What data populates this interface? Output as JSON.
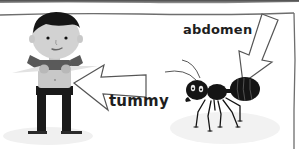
{
  "figure": {
    "labels": {
      "tummy": "tummy",
      "abdomen": "abdomen"
    },
    "subjects": [
      "boy",
      "ant"
    ]
  },
  "colors": {
    "background": "#ffffff",
    "frame_line": "#6e6e6e",
    "top_shadow": "#5a5a5a",
    "hair": "#161616",
    "skin": "#d2d2d2",
    "shirt": "#585858",
    "body_light": "#c8c8c8",
    "trousers": "#1a1a1a",
    "ant": "#141414",
    "text": "#1e1e1e"
  }
}
